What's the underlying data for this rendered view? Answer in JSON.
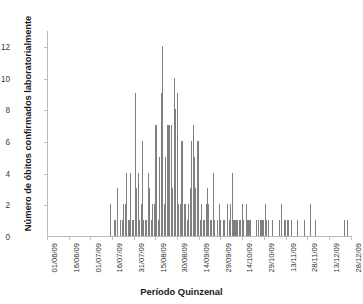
{
  "chart_data": {
    "type": "bar",
    "title": "",
    "subtitle": "",
    "xlabel": "Período Quinzenal",
    "ylabel": "Número de óbitos confirmados laboratorialmente",
    "ylim": [
      0,
      13
    ],
    "yticks": [
      0,
      2,
      4,
      6,
      8,
      10,
      12
    ],
    "grid": false,
    "legend": null,
    "legend_position": "none",
    "bar_color": "#808080",
    "axis_color": "#b8b8b8",
    "x_axis_type": "fortnightly-date-ticks",
    "xtick_labels": [
      "01/06/09",
      "16/06/09",
      "01/07/09",
      "16/07/09",
      "31/07/09",
      "15/08/09",
      "30/08/09",
      "14/09/09",
      "29/09/09",
      "14/10/09",
      "29/10/09",
      "13/11/09",
      "28/11/09",
      "13/12/09",
      "28/12/09"
    ],
    "xtick_positions_index": [
      0,
      15,
      30,
      45,
      60,
      75,
      90,
      105,
      120,
      135,
      150,
      165,
      180,
      195,
      210
    ],
    "n_points": 211,
    "x_start_label": "01/06/09",
    "x_end_label": "28/12/09",
    "max_value": 12,
    "max_value_label": "12",
    "values": [
      0,
      0,
      0,
      0,
      0,
      0,
      0,
      0,
      0,
      0,
      0,
      0,
      0,
      0,
      0,
      0,
      0,
      0,
      0,
      0,
      0,
      0,
      0,
      0,
      0,
      0,
      0,
      0,
      0,
      0,
      0,
      0,
      0,
      0,
      0,
      0,
      0,
      0,
      0,
      0,
      0,
      0,
      0,
      2,
      0,
      0,
      1,
      0,
      3,
      0,
      1,
      1,
      2,
      2,
      4,
      1,
      1,
      4,
      1,
      1,
      9,
      3,
      4,
      1,
      2,
      6,
      1,
      1,
      1,
      4,
      3,
      1,
      2,
      2,
      7,
      7,
      1,
      5,
      9,
      12,
      2,
      5,
      7,
      7,
      7,
      7,
      3,
      10,
      8,
      9,
      2,
      2,
      6,
      6,
      2,
      2,
      1,
      2,
      3,
      6,
      7,
      5,
      3,
      6,
      6,
      1,
      2,
      1,
      1,
      2,
      3,
      2,
      1,
      1,
      4,
      1,
      0,
      1,
      2,
      1,
      0,
      1,
      1,
      0,
      2,
      1,
      2,
      4,
      1,
      1,
      1,
      1,
      1,
      1,
      2,
      1,
      0,
      2,
      1,
      1,
      1,
      0,
      0,
      0,
      1,
      1,
      0,
      1,
      1,
      1,
      2,
      1,
      1,
      0,
      0,
      1,
      0,
      0,
      0,
      0,
      1,
      2,
      0,
      1,
      1,
      1,
      1,
      0,
      1,
      0,
      0,
      0,
      1,
      0,
      0,
      0,
      0,
      1,
      0,
      0,
      0,
      2,
      0,
      0,
      0,
      1,
      0,
      0,
      0,
      0,
      0,
      0,
      0,
      0,
      0,
      0,
      0,
      0,
      0,
      0,
      0,
      0,
      0,
      0,
      0,
      1,
      0,
      1,
      0,
      0,
      0,
      0,
      0,
      0,
      0,
      0,
      0,
      0,
      0,
      0,
      0,
      0,
      0,
      0,
      0,
      0
    ]
  }
}
